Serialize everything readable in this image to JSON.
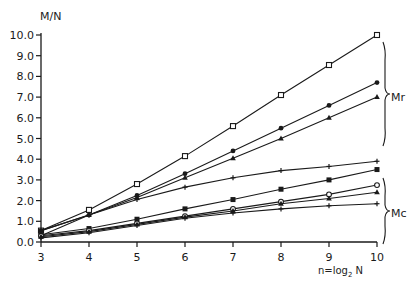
{
  "chart_data": {
    "type": "line",
    "title": "",
    "xlabel": "n=log2 N",
    "ylabel": "M/N",
    "x": [
      3,
      4,
      5,
      6,
      7,
      8,
      9,
      10
    ],
    "xlim": [
      3,
      10
    ],
    "ylim": [
      0,
      10
    ],
    "xticks": [
      "3",
      "4",
      "5",
      "6",
      "7",
      "8",
      "9",
      "10"
    ],
    "yticks": [
      "0.0",
      "1.0",
      "2.0",
      "3.0",
      "4.0",
      "5.0",
      "6.0",
      "7.0",
      "8.0",
      "9.0",
      "10.0"
    ],
    "grid": false,
    "legend": "none",
    "annotations": [
      {
        "text": "Mr",
        "group": "upper three curves (bracket)"
      },
      {
        "text": "Mc",
        "group": "lower four curves (bracket)"
      }
    ],
    "series": [
      {
        "name": "Mr (open square)",
        "group": "Mr",
        "marker": "square-open",
        "values": [
          0.55,
          1.55,
          2.8,
          4.15,
          5.6,
          7.1,
          8.55,
          10.0
        ]
      },
      {
        "name": "Mr (filled circle)",
        "group": "Mr",
        "marker": "circle",
        "values": [
          0.55,
          1.3,
          2.25,
          3.3,
          4.4,
          5.5,
          6.6,
          7.7
        ]
      },
      {
        "name": "Mr (triangle)",
        "group": "Mr",
        "marker": "triangle",
        "values": [
          0.55,
          1.3,
          2.15,
          3.1,
          4.05,
          5.0,
          6.0,
          7.0
        ]
      },
      {
        "name": "Mc (plus)",
        "group": "Mc",
        "marker": "plus",
        "values": [
          0.3,
          1.3,
          2.05,
          2.65,
          3.1,
          3.45,
          3.65,
          3.9
        ]
      },
      {
        "name": "Mc (filled square)",
        "group": "Mc",
        "marker": "square",
        "values": [
          0.35,
          0.65,
          1.1,
          1.6,
          2.05,
          2.55,
          3.0,
          3.5
        ]
      },
      {
        "name": "Mc (open circle)",
        "group": "Mc",
        "marker": "circle-open",
        "values": [
          0.3,
          0.55,
          0.9,
          1.25,
          1.6,
          1.95,
          2.3,
          2.75
        ]
      },
      {
        "name": "Mc (triangle)",
        "group": "Mc",
        "marker": "triangle",
        "values": [
          0.25,
          0.5,
          0.85,
          1.2,
          1.5,
          1.85,
          2.1,
          2.4
        ]
      },
      {
        "name": "Mc (small plus)",
        "group": "Mc",
        "marker": "plus",
        "values": [
          0.2,
          0.45,
          0.8,
          1.15,
          1.4,
          1.6,
          1.75,
          1.85
        ]
      }
    ]
  },
  "labels": {
    "ylabel": "M/N",
    "xlabel_main": "n=log",
    "xlabel_sub": "2",
    "xlabel_end": " N",
    "group_r": "Mr",
    "group_c": "Mc"
  }
}
